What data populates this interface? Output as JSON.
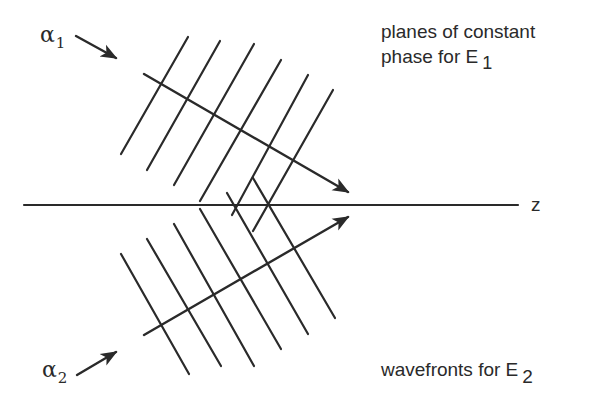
{
  "figure": {
    "type": "wave-interference-diagram",
    "axis": {
      "label": "z",
      "y": 205,
      "x1": 24,
      "x2": 518
    },
    "labels": {
      "alpha1": {
        "symbol": "α",
        "subscript": "1"
      },
      "alpha2": {
        "symbol": "α",
        "subscript": "2"
      },
      "e1_caption_line1": "planes of constant",
      "e1_caption_line2_text": "phase for E",
      "e1_caption_line2_sub": "1",
      "e2_caption_text": "wavefronts for E",
      "e2_caption_sub": "2",
      "edge_fragment": ")"
    },
    "colors": {
      "ink": "#2a2a2a",
      "background": "#ffffff"
    },
    "beam1": {
      "name": "E1",
      "ray": {
        "x1": 144,
        "y1": 74,
        "x2": 348,
        "y2": 192
      },
      "wavefronts": [
        {
          "x1": 188,
          "y1": 37,
          "x2": 121,
          "y2": 154
        },
        {
          "x1": 220,
          "y1": 41,
          "x2": 147,
          "y2": 170
        },
        {
          "x1": 254,
          "y1": 44,
          "x2": 174,
          "y2": 185
        },
        {
          "x1": 281,
          "y1": 60,
          "x2": 200,
          "y2": 201
        },
        {
          "x1": 308,
          "y1": 75,
          "x2": 232,
          "y2": 215
        },
        {
          "x1": 333,
          "y1": 90,
          "x2": 253,
          "y2": 231
        }
      ]
    },
    "beam2": {
      "name": "E2",
      "ray": {
        "x1": 144,
        "y1": 335,
        "x2": 348,
        "y2": 217
      },
      "wavefronts": [
        {
          "x1": 121,
          "y1": 254,
          "x2": 189,
          "y2": 374
        },
        {
          "x1": 147,
          "y1": 239,
          "x2": 221,
          "y2": 366
        },
        {
          "x1": 174,
          "y1": 224,
          "x2": 254,
          "y2": 366
        },
        {
          "x1": 200,
          "y1": 209,
          "x2": 281,
          "y2": 349
        },
        {
          "x1": 227,
          "y1": 193,
          "x2": 308,
          "y2": 334
        },
        {
          "x1": 253,
          "y1": 178,
          "x2": 335,
          "y2": 318
        }
      ]
    },
    "angle_arrows": {
      "alpha1": {
        "x1": 76,
        "y1": 36,
        "x2": 116,
        "y2": 58
      },
      "alpha2": {
        "x1": 77,
        "y1": 375,
        "x2": 116,
        "y2": 352
      }
    }
  }
}
